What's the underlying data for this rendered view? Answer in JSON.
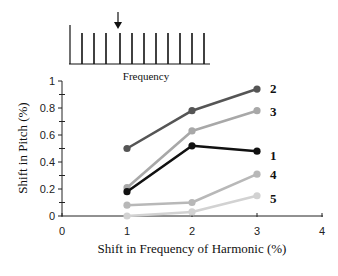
{
  "chart_data": {
    "type": "line",
    "title": "",
    "xlabel": "Shift in Frequency of Harmonic (%)",
    "ylabel": "Shift in Pitch (%)",
    "xlim": [
      0,
      4
    ],
    "ylim": [
      0,
      1
    ],
    "x_ticks": [
      "0",
      "1",
      "2",
      "3",
      "4"
    ],
    "y_ticks": [
      "0",
      "0.2",
      "0.4",
      "0.6",
      "0.8",
      "1"
    ],
    "grid": false,
    "legend_position": "inline-right",
    "x": [
      1,
      2,
      3
    ],
    "series": [
      {
        "name": "1",
        "values": [
          0.18,
          0.52,
          0.48
        ],
        "color": "#111111"
      },
      {
        "name": "2",
        "values": [
          0.5,
          0.78,
          0.94
        ],
        "color": "#555555"
      },
      {
        "name": "3",
        "values": [
          0.21,
          0.63,
          0.78
        ],
        "color": "#a8a8a8"
      },
      {
        "name": "4",
        "values": [
          0.08,
          0.1,
          0.31
        ],
        "color": "#b8b8b8"
      },
      {
        "name": "5",
        "values": [
          0.0,
          0.03,
          0.15
        ],
        "color": "#d2d2d2"
      }
    ],
    "inset": {
      "type": "harmonic-spectrum",
      "label": "Frequency",
      "harmonic_count": 12,
      "shifted_harmonic_index": 4,
      "annotation": "arrow pointing to shifted harmonic"
    }
  }
}
